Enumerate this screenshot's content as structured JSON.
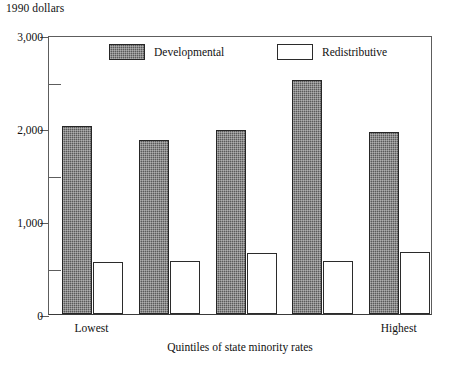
{
  "chart_data": {
    "type": "bar",
    "title": "",
    "unit_label": "1990 dollars",
    "xlabel": "Quintiles of state minority rates",
    "ylabel": "",
    "ylim": [
      0,
      3000
    ],
    "ytick_labels": [
      "0",
      "1,000",
      "2,000",
      "3,000"
    ],
    "ytick_values": [
      0,
      1000,
      2000,
      3000
    ],
    "yminor_values": [
      500,
      1500,
      2500
    ],
    "grid": false,
    "legend_position": "top-inside",
    "categories": [
      "1",
      "2",
      "3",
      "4",
      "5"
    ],
    "category_labels": {
      "first": "Lowest",
      "last": "Highest"
    },
    "series": [
      {
        "name": "Developmental",
        "fill": "hatched-dark",
        "color": "#5a5a5a",
        "values": [
          2020,
          1870,
          1980,
          2520,
          1960
        ]
      },
      {
        "name": "Redistributive",
        "fill": "white",
        "color": "#ffffff",
        "values": [
          560,
          570,
          660,
          565,
          670
        ]
      }
    ]
  },
  "axis": {
    "frame_color": "#5d5d5d",
    "baseline_color": "#3a3a3a"
  }
}
